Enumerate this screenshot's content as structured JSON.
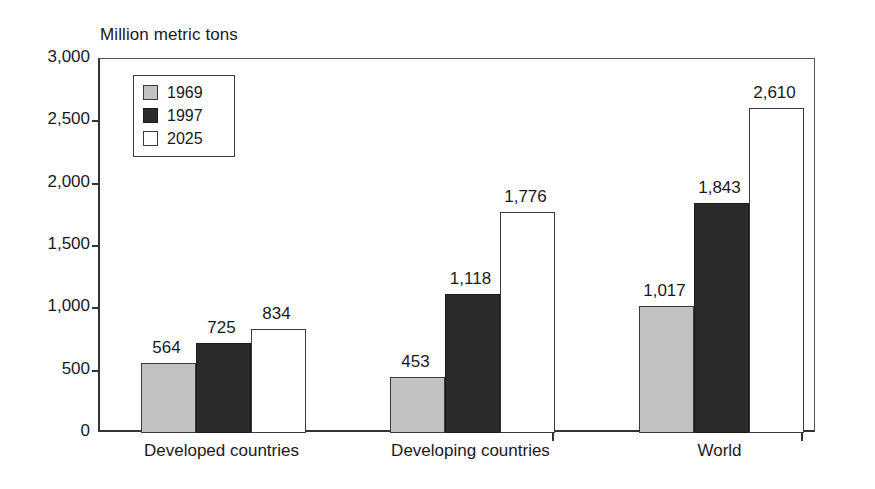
{
  "chart_data": {
    "type": "bar",
    "title": "",
    "ylabel": "Million metric tons",
    "xlabel": "",
    "ylim": [
      0,
      3000
    ],
    "ytick_labels": [
      "3,000",
      "2,500",
      "2,000",
      "1,500",
      "1,000",
      "500",
      "0"
    ],
    "ytick_values": [
      3000,
      2500,
      2000,
      1500,
      1000,
      500,
      0
    ],
    "grid": false,
    "legend_position": "upper-left-inside",
    "categories": [
      "Developed countries",
      "Developing countries",
      "World"
    ],
    "series": [
      {
        "name": "1969",
        "values": [
          564,
          453,
          1017
        ],
        "color": "#c2c2c2"
      },
      {
        "name": "1997",
        "values": [
          725,
          1118,
          1843
        ],
        "color": "#2b2b2b"
      },
      {
        "name": "2025",
        "values": [
          834,
          1776,
          2610
        ],
        "color": "#ffffff"
      }
    ],
    "value_labels": [
      [
        "564",
        "725",
        "834"
      ],
      [
        "453",
        "1,118",
        "1,776"
      ],
      [
        "1,017",
        "1,843",
        "2,610"
      ]
    ]
  },
  "legend": {
    "items": [
      {
        "label": "1969"
      },
      {
        "label": "1997"
      },
      {
        "label": "2025"
      }
    ]
  }
}
